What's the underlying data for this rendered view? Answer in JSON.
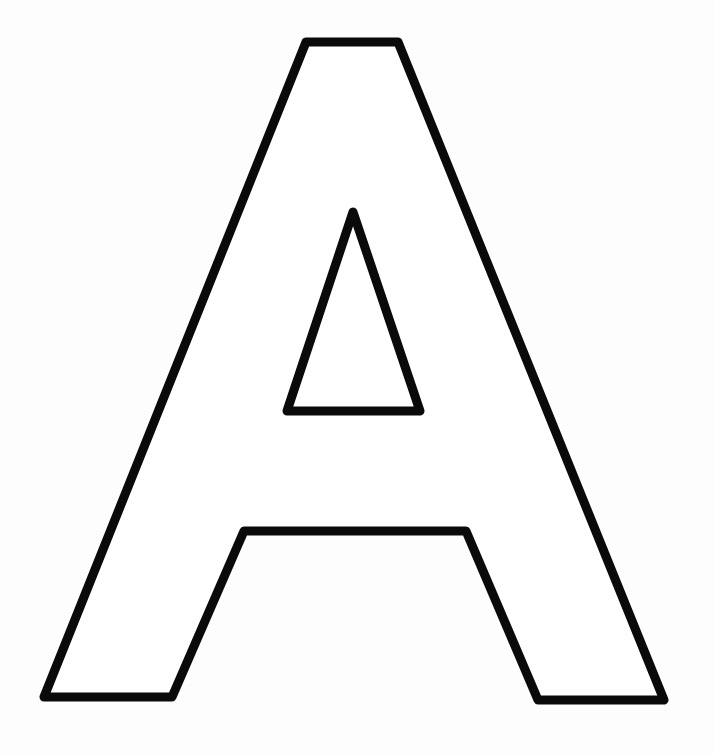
{
  "image": {
    "letter": "A",
    "description": "Outline of the capital letter A (coloring page style)",
    "background_color": "#ffffff",
    "stroke_color": "#0a0a0a",
    "fill_color": "#ffffff",
    "stroke_width": 9
  },
  "shapes": {
    "outer_outline": "306,42 398,42 664,700 538,700 466,531 244,531 172,697 44,697",
    "inner_counter": "353,212 420,411 287,411"
  }
}
